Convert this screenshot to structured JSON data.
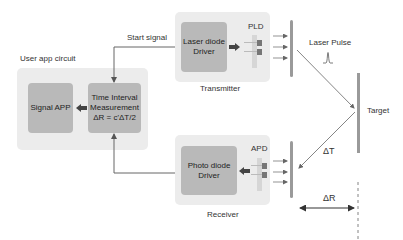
{
  "user_app": {
    "title": "User app circuit",
    "signal_app": "Signal APP",
    "tim_line1": "Time Interval",
    "tim_line2": "Measurement",
    "tim_formula": "ΔR = c'ΔT/2"
  },
  "transmitter": {
    "title": "Transmitter",
    "driver_line1": "Laser diode",
    "driver_line2": "Driver",
    "emitter_label": "PLD"
  },
  "receiver": {
    "title": "Receiver",
    "driver_line1": "Photo diode",
    "driver_line2": "Driver",
    "detector_label": "APD"
  },
  "signals": {
    "start_signal": "Start signal",
    "laser_pulse": "Laser Pulse",
    "target": "Target",
    "delta_t": "ΔT",
    "delta_r": "ΔR"
  },
  "colors": {
    "outer_box": "#ececec",
    "inner_box": "#b9b9b9",
    "line": "#666666",
    "mirror": "#9a9a9a"
  }
}
